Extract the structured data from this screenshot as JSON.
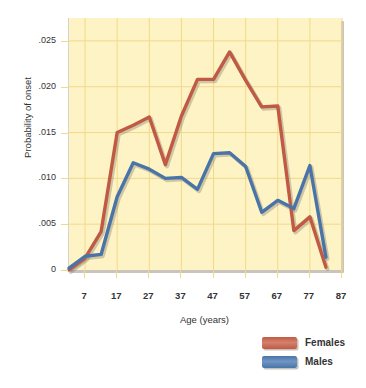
{
  "figure": {
    "clipped_top_title": "probability of onset",
    "background_color": "#ffffff",
    "plot_background_color": "#fdf3c4",
    "grid_color": "#f2d98a"
  },
  "legend": {
    "position": "bottom-right",
    "entries": [
      {
        "label": "Females",
        "color": "#c05a44"
      },
      {
        "label": "Males",
        "color": "#4a74a8"
      }
    ]
  },
  "chart_data": {
    "type": "line",
    "title": "",
    "xlabel": "Age (years)",
    "ylabel": "Probability of onset",
    "xlim": [
      2,
      87
    ],
    "ylim": [
      0,
      0.0275
    ],
    "grid": true,
    "legend_position": "bottom-right",
    "xticks": [
      7,
      17,
      27,
      37,
      47,
      57,
      67,
      77,
      87
    ],
    "xticklabels": [
      "7",
      "17",
      "27",
      "37",
      "47",
      "57",
      "67",
      "77",
      "87"
    ],
    "yticks": [
      0,
      0.005,
      0.01,
      0.015,
      0.02,
      0.025
    ],
    "yticklabels": [
      "0",
      ".005",
      ".010",
      ".015",
      ".020",
      ".025"
    ],
    "x": [
      2,
      7,
      12,
      17,
      22,
      27,
      32,
      37,
      42,
      47,
      52,
      57,
      62,
      67,
      72,
      77,
      82
    ],
    "series": [
      {
        "name": "Females",
        "color": "#c05a44",
        "values": [
          0.0,
          0.0013,
          0.0042,
          0.015,
          0.0158,
          0.0167,
          0.0115,
          0.0168,
          0.0208,
          0.0208,
          0.0238,
          0.0207,
          0.0178,
          0.0179,
          0.0043,
          0.0058,
          0.0003
        ]
      },
      {
        "name": "Males",
        "color": "#4a74a8",
        "values": [
          0.0002,
          0.0015,
          0.0017,
          0.008,
          0.0117,
          0.011,
          0.01,
          0.0101,
          0.0088,
          0.0127,
          0.0128,
          0.0113,
          0.0063,
          0.0076,
          0.0067,
          0.0114,
          0.0014
        ]
      }
    ]
  }
}
